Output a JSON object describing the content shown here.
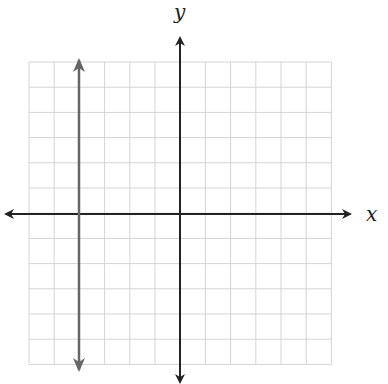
{
  "chart_data": {
    "type": "line",
    "title": "",
    "xlabel": "x",
    "ylabel": "y",
    "xlim": [
      -6,
      6
    ],
    "ylim": [
      -6,
      6
    ],
    "grid": true,
    "series": [
      {
        "name": "vertical line",
        "equation": "x = -4",
        "points": [
          [
            -4,
            6
          ],
          [
            -4,
            -6
          ]
        ],
        "color": "#666666"
      }
    ]
  },
  "labels": {
    "x_axis": "x",
    "y_axis": "y"
  },
  "colors": {
    "grid": "#d0d0d0",
    "axes": "#222222",
    "line": "#666666"
  }
}
